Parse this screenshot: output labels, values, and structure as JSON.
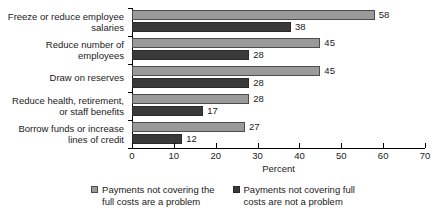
{
  "chart_data": {
    "type": "bar",
    "orientation": "horizontal",
    "title": "",
    "xlabel": "Percent",
    "ylabel": "",
    "xlim": [
      0,
      70
    ],
    "xticks": [
      0,
      10,
      20,
      30,
      40,
      50,
      60,
      70
    ],
    "grid": false,
    "legend_position": "bottom",
    "categories": [
      "Freeze or reduce employee salaries",
      "Reduce number of employees",
      "Draw on reserves",
      "Reduce health, retirement, or staff benefits",
      "Borrow funds or increase lines of credit"
    ],
    "category_lines": [
      [
        "Freeze or reduce employee",
        "salaries"
      ],
      [
        "Reduce number of",
        "employees"
      ],
      [
        "Draw on reserves"
      ],
      [
        "Reduce health, retirement,",
        "or staff benefits"
      ],
      [
        "Borrow funds or increase",
        "lines of credit"
      ]
    ],
    "series": [
      {
        "name": "Payments not covering the full costs are a problem",
        "name_lines": [
          "Payments not covering the",
          "full costs are a problem"
        ],
        "color": "#9a9a9a",
        "values": [
          58,
          45,
          45,
          28,
          27
        ]
      },
      {
        "name": "Payments not covering full costs are not a problem",
        "name_lines": [
          "Payments not covering full",
          "costs are not a problem"
        ],
        "color": "#3a3a3a",
        "values": [
          38,
          28,
          28,
          17,
          12
        ]
      }
    ]
  }
}
